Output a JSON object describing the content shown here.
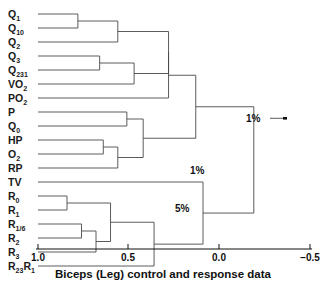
{
  "figure": {
    "type": "dendrogram",
    "caption": "Biceps (Leg) control and response data",
    "orientation": "horizontal-right-to-left"
  },
  "axis": {
    "label": "",
    "ticks": [
      {
        "value": 1.0,
        "text": "1.0",
        "x": 38
      },
      {
        "value": 0.5,
        "text": "0.5",
        "x": 128
      },
      {
        "value": 0.0,
        "text": "0.0",
        "x": 219
      },
      {
        "value": -0.5,
        "text": "−0.5",
        "x": 310
      }
    ],
    "range": [
      1.0,
      -0.5
    ],
    "pixel_range": [
      38,
      310
    ]
  },
  "leaves": [
    {
      "id": "Q1",
      "base": "Q",
      "sub": "1",
      "y": 14
    },
    {
      "id": "Q10",
      "base": "Q",
      "sub": "10",
      "y": 28
    },
    {
      "id": "Q2",
      "base": "Q",
      "sub": "2",
      "y": 42
    },
    {
      "id": "Q3",
      "base": "Q",
      "sub": "3",
      "y": 56
    },
    {
      "id": "Q231",
      "base": "Q",
      "sub": "231",
      "y": 70
    },
    {
      "id": "VO2",
      "base": "VO",
      "sub": "2",
      "y": 84
    },
    {
      "id": "PO2",
      "base": "PO",
      "sub": "2",
      "y": 98
    },
    {
      "id": "P",
      "base": "P",
      "sub": "",
      "y": 112
    },
    {
      "id": "Q0",
      "base": "Q",
      "sub": "0",
      "y": 126
    },
    {
      "id": "HP",
      "base": "HP",
      "sub": "",
      "y": 140
    },
    {
      "id": "O2",
      "base": "O",
      "sub": "2",
      "y": 154
    },
    {
      "id": "RP",
      "base": "RP",
      "sub": "",
      "y": 168
    },
    {
      "id": "TV",
      "base": "TV",
      "sub": "",
      "y": 182
    },
    {
      "id": "R0",
      "base": "R",
      "sub": "0",
      "y": 196
    },
    {
      "id": "R1",
      "base": "R",
      "sub": "1",
      "y": 210
    },
    {
      "id": "R16",
      "base": "R",
      "sub": "1/6",
      "y": 224
    },
    {
      "id": "R2",
      "base": "R",
      "sub": "2",
      "y": 238
    },
    {
      "id": "R3",
      "base": "R",
      "sub": "3",
      "y": 252
    },
    {
      "id": "R23R1",
      "base": "R",
      "sub": "23",
      "base2": "R",
      "sub2": "1",
      "y": 266
    }
  ],
  "chart_data": {
    "type": "dendrogram",
    "title": "Biceps (Leg) control and response data",
    "xlabel": "",
    "ylabel": "",
    "xlim": [
      1.0,
      -0.5
    ],
    "grid": false,
    "legend": "none",
    "labels": [
      "Q1",
      "Q10",
      "Q2",
      "Q3",
      "Q231",
      "VO2",
      "PO2",
      "P",
      "Q0",
      "HP",
      "O2",
      "RP",
      "TV",
      "R0",
      "R1",
      "R1/6",
      "R2",
      "R3",
      "R23R1"
    ],
    "merges": [
      {
        "id": "m1",
        "children": [
          "Q1",
          "Q10"
        ],
        "height": 0.78
      },
      {
        "id": "m2",
        "children": [
          "m1",
          "Q2"
        ],
        "height": 0.56
      },
      {
        "id": "m3",
        "children": [
          "Q3",
          "Q231"
        ],
        "height": 0.66
      },
      {
        "id": "m4",
        "children": [
          "m3",
          "VO2"
        ],
        "height": 0.47
      },
      {
        "id": "m5",
        "children": [
          "m2",
          "m4"
        ],
        "height": 0.28
      },
      {
        "id": "m6",
        "children": [
          "m5",
          "PO2"
        ],
        "height": 0.28
      },
      {
        "id": "m7",
        "children": [
          "P",
          "Q0"
        ],
        "height": 0.51
      },
      {
        "id": "m8",
        "children": [
          "HP",
          "O2"
        ],
        "height": 0.64
      },
      {
        "id": "m9",
        "children": [
          "m8",
          "RP"
        ],
        "height": 0.56
      },
      {
        "id": "m10",
        "children": [
          "m7",
          "m9"
        ],
        "height": 0.42
      },
      {
        "id": "m11",
        "children": [
          "m6",
          "m10"
        ],
        "height": 0.13
      },
      {
        "id": "m12",
        "children": [
          "R0",
          "R1"
        ],
        "height": 0.84
      },
      {
        "id": "m13",
        "children": [
          "R16",
          "R2"
        ],
        "height": 0.76
      },
      {
        "id": "m14",
        "children": [
          "m13",
          "R3"
        ],
        "height": 0.68
      },
      {
        "id": "m15",
        "children": [
          "m12",
          "m14"
        ],
        "height": 0.6
      },
      {
        "id": "m16",
        "children": [
          "m15",
          "R23R1"
        ],
        "height": 0.36
      },
      {
        "id": "m17",
        "children": [
          "TV",
          "m16"
        ],
        "height": 0.09
      },
      {
        "id": "root",
        "children": [
          "m11",
          "m17"
        ],
        "height": -0.19
      }
    ],
    "annotations": [
      {
        "text": "1%",
        "node": "root",
        "x": 267,
        "y": 118
      },
      {
        "text": "1%",
        "node": "m11",
        "x": 211,
        "y": 170
      },
      {
        "text": "5%",
        "node": "m17",
        "x": 196,
        "y": 208
      }
    ]
  },
  "annotations": {
    "root_pct": "1%",
    "mid_pct": "1%",
    "low_pct": "5%"
  }
}
